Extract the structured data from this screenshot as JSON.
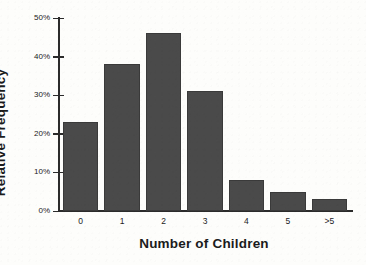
{
  "chart_data": {
    "type": "bar",
    "title": "",
    "xlabel": "Number of Children",
    "ylabel": "Relative Frequency",
    "categories": [
      "0",
      "1",
      "2",
      "3",
      "4",
      "5",
      ">5"
    ],
    "values": [
      23,
      38,
      46,
      31,
      8,
      5,
      3
    ],
    "value_unit": "%",
    "ylim": [
      0,
      50
    ],
    "yticks": [
      0,
      10,
      20,
      30,
      40,
      50
    ],
    "ytick_labels": [
      "0%",
      "10%",
      "20%",
      "30%",
      "40%",
      "50%"
    ],
    "grid": false,
    "legend": false,
    "bar_color": "#4a4a4a",
    "axis_color": "#2b2b2b",
    "background_color": "#fdfdfc"
  },
  "axes": {
    "x_title": "Number of Children",
    "y_title": "Relative Frequency"
  }
}
